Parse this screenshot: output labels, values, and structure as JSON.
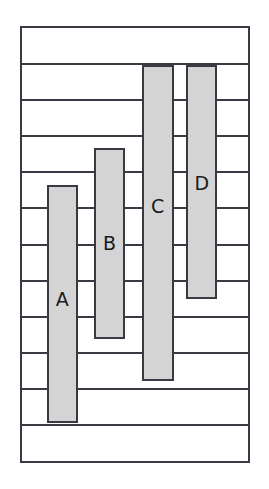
{
  "chart_data": {
    "type": "bar",
    "title": "",
    "subtitle": "",
    "xlabel": "",
    "ylabel": "",
    "categories": [
      "A",
      "B",
      "C",
      "D"
    ],
    "values": [
      6.3,
      5.0,
      8.3,
      6.2
    ],
    "ylim": [
      0,
      11.4
    ],
    "grid": true,
    "grid_orientation": "horizontal",
    "gridline_values": [
      1,
      2,
      3,
      4,
      5,
      6,
      7,
      8,
      9,
      10,
      11
    ],
    "legend": null,
    "legend_position": "none",
    "annotations": [],
    "bar_color": "#d4d4d4",
    "bar_edge_color": "#3a3a42",
    "frame_color": "#3a3a42",
    "background_color": "#ffffff",
    "label_color": "#1a1a1a",
    "series": [
      {
        "name": "series-1",
        "values": [
          6.3,
          5.0,
          8.3,
          6.2
        ]
      }
    ],
    "bars": [
      {
        "label": "A",
        "value": 6.3,
        "x_frac": 0.109,
        "width_frac": 0.139,
        "top_frac": 0.362,
        "bottom_frac": 0.913
      },
      {
        "label": "B",
        "value": 5.0,
        "x_frac": 0.317,
        "width_frac": 0.139,
        "top_frac": 0.277,
        "bottom_frac": 0.719
      },
      {
        "label": "C",
        "value": 8.3,
        "x_frac": 0.53,
        "width_frac": 0.143,
        "top_frac": 0.085,
        "bottom_frac": 0.815
      },
      {
        "label": "D",
        "value": 6.2,
        "x_frac": 0.726,
        "width_frac": 0.139,
        "top_frac": 0.085,
        "bottom_frac": 0.627
      }
    ],
    "label_positions": [
      {
        "label": "A",
        "cx_frac": 0.178,
        "cy_frac": 0.627
      },
      {
        "label": "B",
        "cx_frac": 0.387,
        "cy_frac": 0.497
      },
      {
        "label": "C",
        "cx_frac": 0.6,
        "cy_frac": 0.41
      },
      {
        "label": "D",
        "cx_frac": 0.796,
        "cy_frac": 0.357
      }
    ]
  }
}
